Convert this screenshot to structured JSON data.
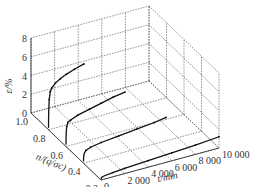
{
  "chart_data": {
    "type": "line",
    "title": "",
    "zlabel": "ε/%",
    "ylabel": "n/(q/σc)",
    "xlabel": "t/min",
    "x_ticks": [
      "0",
      "2 000",
      "4 000",
      "6 000",
      "8 000",
      "10 000"
    ],
    "x_tick_values": [
      0,
      2000,
      4000,
      6000,
      8000,
      10000
    ],
    "y_ticks": [
      "1.0",
      "0.8",
      "0.6",
      "0.4",
      "0.2"
    ],
    "y_tick_values": [
      1.0,
      0.8,
      0.6,
      0.4,
      0.2
    ],
    "z_ticks": [
      "0",
      "2",
      "4",
      "6",
      "8"
    ],
    "z_tick_values": [
      0,
      2,
      4,
      6,
      8
    ],
    "xlim": [
      0,
      10000
    ],
    "ylim": [
      0.2,
      1.0
    ],
    "zlim": [
      0,
      8
    ],
    "grid": true,
    "series": [
      {
        "name": "n=0.8",
        "n": 0.8,
        "t": [
          0,
          5,
          20,
          60,
          150,
          300,
          600,
          1000,
          1500,
          2200,
          3000
        ],
        "eps": [
          0.2,
          1.0,
          2.0,
          3.2,
          4.0,
          4.4,
          4.8,
          5.1,
          5.4,
          5.7,
          6.0
        ]
      },
      {
        "name": "n=0.6",
        "n": 0.6,
        "t": [
          0,
          5,
          20,
          60,
          150,
          400,
          1000,
          2000,
          3000,
          4000,
          5000
        ],
        "eps": [
          0.2,
          0.8,
          1.5,
          2.1,
          2.5,
          2.7,
          3.0,
          3.3,
          3.6,
          3.9,
          4.1
        ]
      },
      {
        "name": "n=0.4",
        "n": 0.4,
        "t": [
          0,
          10,
          50,
          200,
          600,
          1500,
          3000,
          4500,
          6000,
          7000
        ],
        "eps": [
          0.2,
          0.6,
          1.0,
          1.3,
          1.5,
          1.7,
          1.9,
          2.1,
          2.3,
          2.5
        ]
      },
      {
        "name": "n=0.2",
        "n": 0.2,
        "t": [
          0,
          50,
          300,
          1000,
          2000,
          4000,
          6000,
          8000,
          10000
        ],
        "eps": [
          0.1,
          0.25,
          0.35,
          0.45,
          0.55,
          0.7,
          0.85,
          1.0,
          1.2
        ]
      }
    ]
  }
}
